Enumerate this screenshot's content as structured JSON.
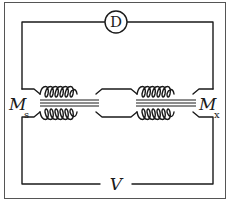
{
  "diagram": {
    "type": "circuit",
    "detector_label": "D",
    "source_label": "V",
    "left_inductor": {
      "label": "M",
      "subscript": "s"
    },
    "right_inductor": {
      "label": "M",
      "subscript": "x"
    },
    "colors": {
      "line": "#1a1a1a",
      "frame": "#555555",
      "background": "#ffffff"
    }
  }
}
